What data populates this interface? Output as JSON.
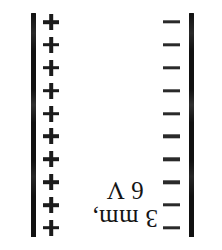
{
  "figure": {
    "background_color": "#ffffff",
    "plate_color": "#111111",
    "text_color": "#141414",
    "left_plate": {
      "label": "positive plate",
      "polarity": "+",
      "charge_symbol": "plus",
      "charge_count": 10
    },
    "right_plate": {
      "label": "negative plate",
      "polarity": "-",
      "charge_symbol": "minus",
      "charge_count": 10
    },
    "caption": {
      "orientation": "rotated-180",
      "line1": "3 mm,",
      "line2": "6 V"
    },
    "annotations": {
      "separation": "3 mm,",
      "voltage": "6 V"
    }
  }
}
